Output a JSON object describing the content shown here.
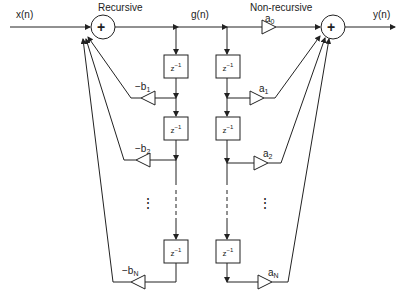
{
  "diagram": {
    "type": "IIR filter block diagram (direct form II)",
    "signals": {
      "input": "x(n)",
      "intermediate": "g(n)",
      "output": "y(n)"
    },
    "section_labels": {
      "recursive": "Recursive",
      "nonrecursive": "Non-recursive"
    },
    "delay_label": {
      "base": "z",
      "exp": "−1"
    },
    "feedback_gains": [
      {
        "prefix": "−b",
        "sub": "1"
      },
      {
        "prefix": "−b",
        "sub": "2"
      },
      {
        "prefix": "−b",
        "sub": "N"
      }
    ],
    "feedforward_gains": [
      {
        "prefix": "a",
        "sub": "0"
      },
      {
        "prefix": "a",
        "sub": "1"
      },
      {
        "prefix": "a",
        "sub": "2"
      },
      {
        "prefix": "a",
        "sub": "N"
      }
    ],
    "adder_symbol": "+",
    "ellipsis": "⋮",
    "colors": {
      "line": "#222222",
      "background": "#ffffff"
    }
  }
}
